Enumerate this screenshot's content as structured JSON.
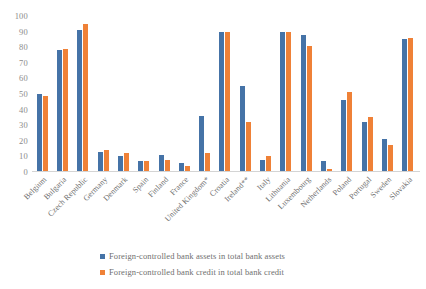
{
  "chart_data": {
    "type": "bar",
    "title": "",
    "subtitle": "",
    "xlabel": "",
    "ylabel": "",
    "ylim": [
      0,
      100
    ],
    "y_ticks": [
      100,
      90,
      80,
      70,
      60,
      50,
      40,
      30,
      20,
      10,
      0
    ],
    "grid": false,
    "legend_position": "bottom",
    "categories": [
      "Belgium",
      "Bulgaria",
      "Czech Republic",
      "Germany",
      "Denmark",
      "Spain",
      "Finland",
      "France",
      "United Kingdom*",
      "Croatia",
      "Ireland**",
      "Italy",
      "Lithuania",
      "Luxembourg",
      "Netherlands",
      "Poland",
      "Portugal",
      "Sweden",
      "Slovakia"
    ],
    "series": [
      {
        "name": "Foreign-controlled bank assets in total bank assets",
        "color": "#4573a7",
        "values": [
          50,
          78,
          91,
          13,
          10,
          7,
          11,
          6,
          36,
          90,
          55,
          8,
          90,
          88,
          7,
          46,
          32,
          21,
          85
        ]
      },
      {
        "name": "Foreign-controlled bank credit in total bank credit",
        "color": "#ef8137",
        "values": [
          49,
          79,
          95,
          14,
          12,
          7,
          8,
          4,
          12,
          90,
          32,
          10,
          90,
          81,
          2,
          51,
          35,
          17,
          86
        ]
      }
    ]
  },
  "colors": {
    "series_a": "#4573a7",
    "series_b": "#ef8137",
    "axis_line": "#d4d4d4",
    "tick_text": "#8c8c8c",
    "label_text": "#6f6f6f",
    "background": "#ffffff"
  }
}
